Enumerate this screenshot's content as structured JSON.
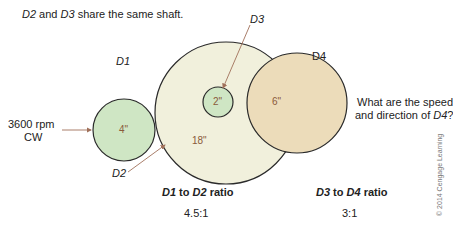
{
  "header": {
    "note_part1": "D2",
    "note_part2": " and ",
    "note_part3": "D3",
    "note_part4": " share the same shaft."
  },
  "labels": {
    "d1": "D1",
    "d2": "D2",
    "d3": "D3",
    "d4": "D4",
    "input_speed": "3600 rpm",
    "input_direction": "CW"
  },
  "pulleys": [
    {
      "id": "D1",
      "diameter_label": "4\"",
      "fill": "#cfe6c4"
    },
    {
      "id": "D2",
      "diameter_label": "18\"",
      "fill": "#f1f0dc"
    },
    {
      "id": "D3",
      "diameter_label": "2\"",
      "fill": "#cfe6c4"
    },
    {
      "id": "D4",
      "diameter_label": "6\"",
      "fill": "#ecdcba"
    }
  ],
  "question": {
    "line1": "What are the speed",
    "line2_prefix": "and direction of ",
    "line2_var": "D4",
    "line2_suffix": "?"
  },
  "ratios": {
    "r1_var1": "D1",
    "r1_mid": " to ",
    "r1_var2": "D2",
    "r1_suffix": " ratio",
    "r1_value": "4.5:1",
    "r2_var1": "D3",
    "r2_mid": " to ",
    "r2_var2": "D4",
    "r2_suffix": " ratio",
    "r2_value": "3:1"
  },
  "copyright": "© 2014 Cengage Learning",
  "colors": {
    "outline": "#2a2a2a",
    "arrow": "#a0705a",
    "size_label": "#8a5a3a"
  }
}
